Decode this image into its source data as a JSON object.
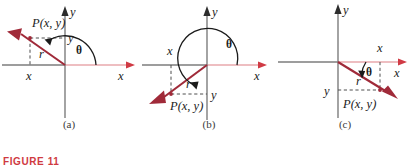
{
  "figure": {
    "label": "FIGURE 11",
    "label_color": "#cf3a3f",
    "captions": {
      "a": "(a)",
      "b": "(b)",
      "c": "(c)"
    }
  },
  "colors": {
    "vector": "#a02a39",
    "axis_gray": "#7d7d7d",
    "axis_positive_x": "#e8a8ac",
    "arrow_red": "#d03a44",
    "dash_gray": "#5a5a5a",
    "text": "#1b1b1b",
    "arc": "#1b1b1b"
  },
  "panels": [
    {
      "id": "a",
      "caption": "(a)",
      "quadrant": "II",
      "axis_labels": {
        "x": "x",
        "y": "y"
      },
      "point_label": "P(x, y)",
      "radius_label": "r",
      "angle_label": "θ",
      "leg_x_label": "x",
      "leg_y_label": "y",
      "origin": {
        "x": 65,
        "y": 65
      },
      "terminal_point": {
        "x": 18,
        "y": 33
      },
      "angle_deg": 145
    },
    {
      "id": "b",
      "caption": "(b)",
      "quadrant": "III",
      "axis_labels": {
        "x": "x",
        "y": "y"
      },
      "point_label": "P(x, y)",
      "radius_label": "r",
      "angle_label": "θ",
      "leg_x_label": "x",
      "leg_y_label": "y",
      "origin": {
        "x": 67,
        "y": 65
      },
      "terminal_point": {
        "x": 18,
        "y": 100
      },
      "angle_deg": 215
    },
    {
      "id": "c",
      "caption": "(c)",
      "quadrant": "IV",
      "axis_labels": {
        "x": "x",
        "y": "y"
      },
      "point_label": "P(x, y)",
      "radius_label": "r",
      "angle_label": "θ",
      "leg_x_label": "x",
      "leg_y_label": "y",
      "origin": {
        "x": 62,
        "y": 57
      },
      "terminal_point": {
        "x": 120,
        "y": 95
      },
      "angle_deg": -33
    }
  ]
}
